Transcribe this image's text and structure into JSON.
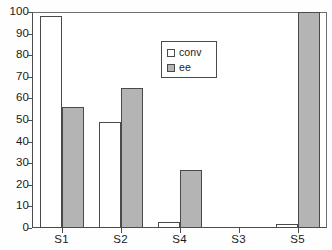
{
  "chart_data": {
    "type": "bar",
    "title": "",
    "subtitle": "",
    "xlabel": "",
    "ylabel": "",
    "categories": [
      "S1",
      "S2",
      "S4",
      "S3",
      "S5"
    ],
    "series": [
      {
        "name": "conv",
        "values": [
          98,
          49,
          3,
          0,
          2
        ],
        "color": "#ffffff"
      },
      {
        "name": "ee",
        "values": [
          56,
          65,
          27,
          0,
          100
        ],
        "color": "#b4b4b4"
      }
    ],
    "ylim": [
      0,
      100
    ],
    "ytick_step": 10,
    "yticks": [
      0,
      10,
      20,
      30,
      40,
      50,
      60,
      70,
      80,
      90,
      100
    ],
    "ytick_labels": [
      "0",
      "10",
      "20",
      "30",
      "40",
      "50",
      "60",
      "70",
      "80",
      "90",
      "100"
    ],
    "grid": true,
    "grid_axis": "y",
    "legend_position": "upper-center",
    "legend_entries": [
      "conv",
      "ee"
    ],
    "annotations": []
  },
  "colors": {
    "axis": "#4d4d4d",
    "gridline": "#8b8b8b",
    "bar_conv": "#ffffff",
    "bar_ee": "#b4b4b4",
    "bar_outline": "#4a4a4a",
    "text": "#1a1a1a",
    "background": "#ffffff"
  },
  "legend": {
    "items": [
      {
        "label": "conv",
        "swatch": "white-square-swatch"
      },
      {
        "label": "ee",
        "swatch": "gray-square-swatch"
      }
    ]
  }
}
